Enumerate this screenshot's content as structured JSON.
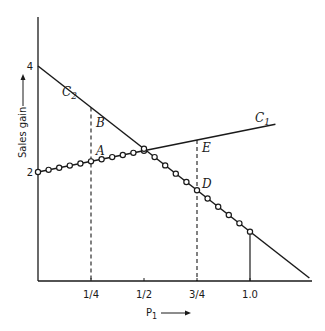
{
  "chart_data": {
    "type": "line",
    "title": "",
    "xlabel": "P1",
    "ylabel": "Sales gain",
    "xlim": [
      0,
      1.3
    ],
    "ylim": [
      0,
      5
    ],
    "grid": false,
    "legend": "none",
    "x_ticks": [
      {
        "value": 0.25,
        "label": "1/4"
      },
      {
        "value": 0.5,
        "label": "1/2"
      },
      {
        "value": 0.75,
        "label": "3/4"
      },
      {
        "value": 1.0,
        "label": "1.0"
      }
    ],
    "y_ticks": [
      {
        "value": 2,
        "label": "2"
      },
      {
        "value": 4,
        "label": "4"
      }
    ],
    "series": [
      {
        "name": "C1",
        "label": "C1",
        "x": [
          0,
          1.12
        ],
        "y": [
          2,
          2.9
        ],
        "marker_x": [
          0,
          0.05,
          0.1,
          0.15,
          0.2,
          0.25,
          0.3,
          0.35,
          0.4,
          0.45,
          0.5
        ]
      },
      {
        "name": "C2",
        "label": "C2",
        "x": [
          0,
          1.28
        ],
        "y": [
          4,
          0
        ],
        "marker_x": [
          0.5,
          0.55,
          0.6,
          0.65,
          0.7,
          0.75,
          0.8,
          0.85,
          0.9,
          0.95,
          1.0
        ]
      }
    ],
    "point_labels": [
      {
        "name": "A",
        "x": 0.25,
        "curve": "C1"
      },
      {
        "name": "B",
        "x": 0.25,
        "curve": "C2"
      },
      {
        "name": "D",
        "x": 0.75,
        "curve": "C2"
      },
      {
        "name": "E",
        "x": 0.75,
        "curve": "C1"
      }
    ],
    "dashed_verticals": [
      {
        "x": 0.25,
        "to_curve": "C2"
      },
      {
        "x": 0.75,
        "to_curve": "C1"
      }
    ],
    "solid_verticals": [
      {
        "x": 1.0,
        "to_curve": "C2"
      }
    ]
  }
}
